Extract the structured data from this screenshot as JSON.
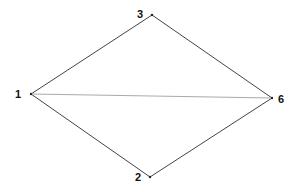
{
  "diagram": {
    "type": "graph",
    "nodes": [
      {
        "id": "1",
        "label": "1",
        "x": 31,
        "y": 94
      },
      {
        "id": "2",
        "label": "2",
        "x": 150,
        "y": 177
      },
      {
        "id": "3",
        "label": "3",
        "x": 152,
        "y": 15
      },
      {
        "id": "6",
        "label": "6",
        "x": 272,
        "y": 98
      }
    ],
    "edges": [
      {
        "from": "1",
        "to": "3",
        "color": "#444444"
      },
      {
        "from": "3",
        "to": "6",
        "color": "#444444"
      },
      {
        "from": "1",
        "to": "2",
        "color": "#444444"
      },
      {
        "from": "2",
        "to": "6",
        "color": "#444444"
      },
      {
        "from": "1",
        "to": "6",
        "color": "#aaaaaa"
      }
    ]
  }
}
